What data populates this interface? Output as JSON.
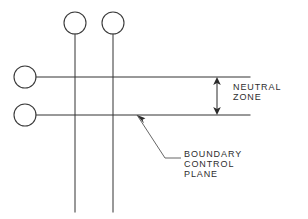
{
  "diagram": {
    "background_color": "#ffffff",
    "line_color": "#333333",
    "text_color": "#2e2e2e",
    "labels": {
      "neutral_zone_line1": "NEUTRAL",
      "neutral_zone_line2": "ZONE",
      "boundary_line1": "BOUNDARY",
      "boundary_line2": "CONTROL",
      "boundary_line3": "PLANE"
    },
    "elements": {
      "top_circle_left": "top-node-left",
      "top_circle_right": "top-node-right",
      "side_circle_upper": "side-node-upper",
      "side_circle_lower": "side-node-lower",
      "upper_boundary_line": "upper-boundary-line",
      "lower_boundary_line": "lower-boundary-line",
      "vertical_stem_left": "vertical-stem-left",
      "vertical_stem_right": "vertical-stem-right",
      "dimension_arrow": "neutral-zone-dimension-arrow",
      "leader": "boundary-control-plane-leader"
    }
  }
}
